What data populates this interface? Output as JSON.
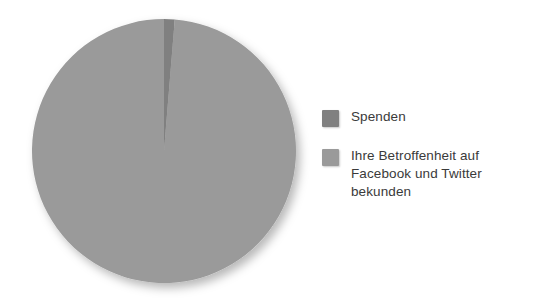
{
  "chart_data": {
    "type": "pie",
    "title": "",
    "categories": [
      "Spenden",
      "Ihre Betroffenheit auf Facebook und Twitter bekunden"
    ],
    "values": [
      1.3,
      98.7
    ],
    "colors": [
      "#808080",
      "#9a9a9a"
    ],
    "legend_position": "right",
    "grid": false,
    "start_angle_deg": 0,
    "direction": "clockwise",
    "labels_shown": false,
    "slices": [
      {
        "label": "Spenden",
        "value": 1.3,
        "color": "#808080"
      },
      {
        "label": "Ihre Betroffenheit auf Facebook und Twitter bekunden",
        "value": 98.7,
        "color": "#9a9a9a"
      }
    ]
  },
  "legend": {
    "items": [
      {
        "label": "Spenden",
        "color": "#808080"
      },
      {
        "label": "Ihre Betroffenheit auf\nFacebook und Twitter\nbekunden",
        "color": "#9a9a9a"
      }
    ]
  },
  "colors": {
    "background": "#ffffff",
    "slice_dark": "#808080",
    "slice_light": "#9a9a9a",
    "text": "#3a3a3a"
  }
}
